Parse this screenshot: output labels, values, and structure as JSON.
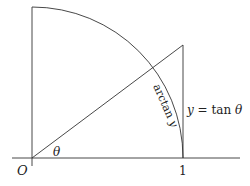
{
  "diagram": {
    "origin_label": "O",
    "unit_label": "1",
    "angle_label": "θ",
    "tan_label": "y = tan θ",
    "tan_label_parts": {
      "y": "y",
      "eq": " = tan ",
      "theta": "θ"
    },
    "arc_label": "arctan y",
    "arc_label_parts": {
      "arctan": "arctan ",
      "y": "y"
    },
    "colors": {
      "stroke": "#333333",
      "text": "#222222",
      "background": "#ffffff"
    }
  }
}
